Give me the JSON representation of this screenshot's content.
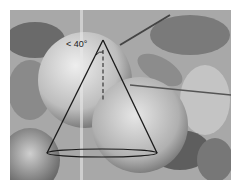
{
  "figure": {
    "angle_label": "< 40°",
    "colors": {
      "line": "#1a1a1a",
      "fruit": "#cfcfcf",
      "leaf": "#5a5a5a",
      "background": "#9a9a9a"
    }
  }
}
